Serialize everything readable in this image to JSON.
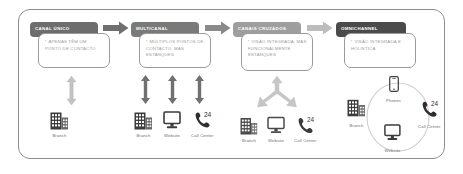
{
  "diagram": {
    "frame_border_color": "#8d8d8d",
    "background": "#ffffff"
  },
  "stages": [
    {
      "id": "canal-unico",
      "header": "CANAL ÚNICO",
      "header_color": "#6d6d6d",
      "body": "APENAS TÊM UM PONTO DE CONTACTO",
      "arrow_type": "double-vertical",
      "arrow_color": "#bdbdbd",
      "arrow_count": 1,
      "channels": [
        {
          "label": "Branch",
          "icon": "building-icon"
        }
      ]
    },
    {
      "id": "multicanal",
      "header": "MULTICANAL",
      "header_color": "#7a7a7a",
      "body": "MÚLTIPLOS PONTOS DE CONTACTO, MAS ESTANQUES",
      "arrow_type": "double-vertical",
      "arrow_color": "#6f6f6f",
      "arrow_count": 3,
      "channels": [
        {
          "label": "Branch",
          "icon": "building-icon"
        },
        {
          "label": "Website",
          "icon": "monitor-icon"
        },
        {
          "label": "Call Center",
          "icon": "phone-24-icon"
        }
      ]
    },
    {
      "id": "canais-cruzados",
      "header": "CANAIS CRUZADOS",
      "header_color": "#9e9e9e",
      "body": "VISÃO INTEGRADA, MAS FUNCIONALMENTE ESTANQUES",
      "arrow_type": "converging-merge",
      "arrow_color": "#c6c6c6",
      "arrow_count": 1,
      "channels": [
        {
          "label": "Branch",
          "icon": "building-icon"
        },
        {
          "label": "Website",
          "icon": "monitor-icon"
        },
        {
          "label": "Call Center",
          "icon": "phone-24-icon"
        }
      ]
    },
    {
      "id": "omnichannel",
      "header": "OMNICHANNEL",
      "header_color": "#4a4a4a",
      "body": "VISÃO INTEGRADA E HOLÍSTICA",
      "arrow_type": "circular-ring",
      "arrow_color": "#c6c6c6",
      "arrow_count": 0,
      "channels": [
        {
          "label": "Phones",
          "icon": "smartphone-icon"
        },
        {
          "label": "Call Center",
          "icon": "phone-24-icon"
        },
        {
          "label": "Website",
          "icon": "monitor-icon"
        },
        {
          "label": "Branch",
          "icon": "building-icon"
        }
      ]
    }
  ],
  "connectors": [
    {
      "from": "canal-unico",
      "to": "multicanal",
      "icon": "arrow-right-icon",
      "color": "#6f6f6f"
    },
    {
      "from": "multicanal",
      "to": "canais-cruzados",
      "icon": "arrow-right-icon",
      "color": "#8a8a8a"
    },
    {
      "from": "canais-cruzados",
      "to": "omnichannel",
      "icon": "arrow-right-icon",
      "color": "#bdbdbd"
    }
  ],
  "phone_badge": "24"
}
